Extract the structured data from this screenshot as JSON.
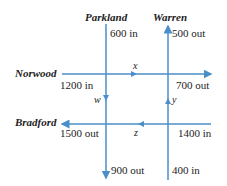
{
  "diagram": {
    "type": "traffic-flow-network",
    "line_color": "#4a8fc9",
    "streets": {
      "parkland": "Parkland",
      "warren": "Warren",
      "norwood": "Norwood",
      "bradford": "Bradford"
    },
    "flows": {
      "parkland_top": "600 in",
      "warren_top": "500 out",
      "norwood_left": "1200 in",
      "norwood_right": "700 out",
      "bradford_left": "1500 out",
      "bradford_right": "1400 in",
      "parkland_bottom": "900 out",
      "warren_bottom": "400 in"
    },
    "variables": {
      "x": "x",
      "y": "y",
      "z": "z",
      "w": "w"
    }
  }
}
